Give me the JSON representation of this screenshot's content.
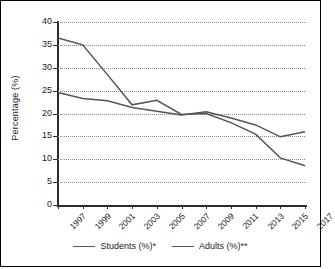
{
  "chart_data": {
    "type": "line",
    "title": "",
    "xlabel": "",
    "ylabel": "Percentage (%)",
    "x": [
      1997,
      1999,
      2001,
      2003,
      2005,
      2007,
      2009,
      2011,
      2013,
      2015,
      2017
    ],
    "categories": [
      "1997",
      "1999",
      "2001",
      "2003",
      "2005",
      "2007",
      "2009",
      "2011",
      "2013",
      "2015",
      "2017"
    ],
    "series": [
      {
        "name": "Students (%)*",
        "color": "#555555",
        "values": [
          24.6,
          23.3,
          22.8,
          21.3,
          20.5,
          19.7,
          20.4,
          19.0,
          17.5,
          14.9,
          16.0
        ]
      },
      {
        "name": "Adults (%)**",
        "color": "#555555",
        "values": [
          36.5,
          35.0,
          28.5,
          21.9,
          22.9,
          19.8,
          20.0,
          18.0,
          15.5,
          10.3,
          8.6
        ]
      }
    ],
    "ylim": [
      0,
      40
    ],
    "yticks": [
      0,
      5,
      10,
      15,
      20,
      25,
      30,
      35,
      40
    ],
    "ytick_labels": [
      "0",
      "5",
      "10",
      "15",
      "20",
      "25",
      "30",
      "35",
      "40"
    ],
    "xlim": [
      1997,
      2017
    ],
    "grid": "horizontal-dotted",
    "legend_position": "bottom-center",
    "legend": [
      "Students (%)*",
      "Adults (%)**"
    ]
  },
  "axis": {
    "y_title": "Percentage (%)"
  },
  "legend": {
    "items": [
      {
        "label": "Students (%)*"
      },
      {
        "label": "Adults (%)**"
      }
    ]
  }
}
